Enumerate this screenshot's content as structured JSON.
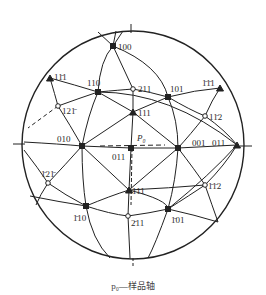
{
  "diagram": {
    "type": "stereographic-projection",
    "caption": "p₀—样品轴",
    "axis_label": "P₀",
    "poles": [
      {
        "id": "100",
        "label": "100",
        "x": 113,
        "y": 46,
        "marker": "square"
      },
      {
        "id": "110",
        "label": "110",
        "x": 98,
        "y": 92,
        "marker": "square"
      },
      {
        "id": "211",
        "label": "211",
        "x": 133,
        "y": 89,
        "marker": "circle"
      },
      {
        "id": "101",
        "label": "101",
        "x": 168,
        "y": 97,
        "marker": "square"
      },
      {
        "id": "1-11",
        "label": "1̄1̄1 ",
        "x": 220,
        "y": 88,
        "marker": "triangle"
      },
      {
        "id": "11-1",
        "label": "111̄",
        "x": 50,
        "y": 78,
        "marker": "triangle"
      },
      {
        "id": "12-1",
        "label": "121̄",
        "x": 58,
        "y": 106,
        "marker": "circle"
      },
      {
        "id": "111",
        "label": "111",
        "x": 133,
        "y": 112,
        "marker": "triangle"
      },
      {
        "id": "1-12",
        "label": "11̄2",
        "x": 205,
        "y": 116,
        "marker": "circle"
      },
      {
        "id": "010",
        "label": "010",
        "x": 82,
        "y": 146,
        "marker": "square"
      },
      {
        "id": "011a",
        "label": "011",
        "x": 131,
        "y": 148,
        "marker": "square"
      },
      {
        "id": "001",
        "label": "001",
        "x": 178,
        "y": 148,
        "marker": "square"
      },
      {
        "id": "011b",
        "label": "011",
        "x": 237,
        "y": 145,
        "marker": "triangle"
      },
      {
        "id": "-12-1",
        "label": "1̄21̄",
        "x": 48,
        "y": 183,
        "marker": "circle"
      },
      {
        "id": "-111",
        "label": "1̄11",
        "x": 129,
        "y": 190,
        "marker": "triangle"
      },
      {
        "id": "-1-12",
        "label": "1̄1̄2",
        "x": 205,
        "y": 185,
        "marker": "circle"
      },
      {
        "id": "-110",
        "label": "1̄10",
        "x": 86,
        "y": 206,
        "marker": "square"
      },
      {
        "id": "-211",
        "label": "2̄11",
        "x": 128,
        "y": 216,
        "marker": "circle"
      },
      {
        "id": "-101",
        "label": "1̄01",
        "x": 168,
        "y": 209,
        "marker": "square"
      }
    ],
    "labels": [
      {
        "text": "100",
        "x": 118,
        "y": 50
      },
      {
        "text": "11̄1",
        "x": 54,
        "y": 80
      },
      {
        "text": "110",
        "x": 87,
        "y": 86
      },
      {
        "text": "211",
        "x": 138,
        "y": 92
      },
      {
        "text": "101",
        "x": 170,
        "y": 92
      },
      {
        "text": "1̄1̄1",
        "x": 202,
        "y": 86
      },
      {
        "text": "121̄",
        "x": 62,
        "y": 114
      },
      {
        "text": "111",
        "x": 138,
        "y": 116
      },
      {
        "text": "11̄2",
        "x": 209,
        "y": 120
      },
      {
        "text": "010",
        "x": 57,
        "y": 142
      },
      {
        "text": "011",
        "x": 112,
        "y": 160
      },
      {
        "text": "001",
        "x": 192,
        "y": 146
      },
      {
        "text": "011",
        "x": 212,
        "y": 146
      },
      {
        "text": "1̄21̄",
        "x": 41,
        "y": 177
      },
      {
        "text": "1̄11",
        "x": 132,
        "y": 194
      },
      {
        "text": "1̄1̄2",
        "x": 208,
        "y": 189
      },
      {
        "text": "1̄10",
        "x": 73,
        "y": 221
      },
      {
        "text": "2̄11",
        "x": 131,
        "y": 226
      },
      {
        "text": "1̄01",
        "x": 171,
        "y": 223
      }
    ]
  }
}
